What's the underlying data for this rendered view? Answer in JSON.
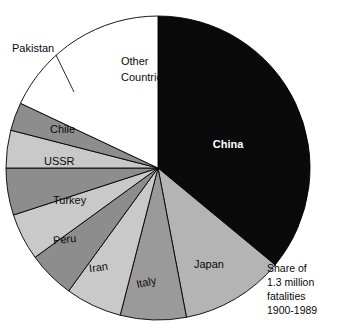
{
  "chart_data": {
    "type": "pie",
    "title": "",
    "caption_lines": [
      "Share of",
      "1.3 million",
      "fatalities",
      "1900-1989"
    ],
    "legend_position": "in-slice labels",
    "grid": false,
    "units": "percent of 1.3 million fatalities",
    "categories": [
      "China",
      "Japan",
      "Italy",
      "Iran",
      "Peru",
      "Turkey",
      "USSR",
      "Chile",
      "Pakistan",
      "Other Countries"
    ],
    "values": [
      36,
      11,
      7,
      6,
      5,
      5,
      5,
      4,
      3,
      18
    ],
    "slices": [
      {
        "label": "China",
        "value": 36,
        "start_angle": 0,
        "end_angle": 129.6,
        "fill": "#0a0a0a",
        "label_fill": "#ffffff",
        "label_x": 228,
        "label_y": 148,
        "label_anchor": "middle",
        "label_bold": true,
        "callout": false
      },
      {
        "label": "Japan",
        "value": 11,
        "start_angle": 129.6,
        "end_angle": 169.2,
        "fill": "#b4b4b4",
        "label_fill": "#0a0a0a",
        "label_x": 209,
        "label_y": 268,
        "label_anchor": "middle",
        "label_bold": false,
        "callout": false
      },
      {
        "label": "Italy",
        "value": 7,
        "start_angle": 169.2,
        "end_angle": 194.4,
        "fill": "#9a9a9a",
        "label_fill": "#0a0a0a",
        "label_x": 147,
        "label_y": 286,
        "label_anchor": "middle",
        "label_bold": false,
        "callout": false
      },
      {
        "label": "Iran",
        "value": 6,
        "start_angle": 194.4,
        "end_angle": 216.0,
        "fill": "#c9c9c9",
        "label_fill": "#0a0a0a",
        "label_x": 99,
        "label_y": 271,
        "label_anchor": "middle",
        "label_bold": false,
        "callout": false
      },
      {
        "label": "Peru",
        "value": 5,
        "start_angle": 216.0,
        "end_angle": 234.0,
        "fill": "#8d8d8d",
        "label_fill": "#0a0a0a",
        "label_x": 65,
        "label_y": 243,
        "label_anchor": "middle",
        "label_bold": false,
        "callout": false
      },
      {
        "label": "Turkey",
        "value": 5,
        "start_angle": 234.0,
        "end_angle": 252.0,
        "fill": "#c9c9c9",
        "label_fill": "#0a0a0a",
        "label_x": 53,
        "label_y": 204,
        "label_anchor": "middle",
        "label_bold": false,
        "callout": false
      },
      {
        "label": "USSR",
        "value": 5,
        "start_angle": 252.0,
        "end_angle": 270.0,
        "fill": "#8d8d8d",
        "label_fill": "#0a0a0a",
        "label_x": 44,
        "label_y": 165,
        "label_anchor": "middle",
        "label_bold": false,
        "callout": false
      },
      {
        "label": "Chile",
        "value": 4,
        "start_angle": 270.0,
        "end_angle": 284.4,
        "fill": "#c9c9c9",
        "label_fill": "#0a0a0a",
        "label_x": 50,
        "label_y": 133,
        "label_anchor": "middle",
        "label_bold": false,
        "callout": false
      },
      {
        "label": "Pakistan",
        "value": 3,
        "start_angle": 284.4,
        "end_angle": 295.2,
        "fill": "#8d8d8d",
        "label_fill": "#0a0a0a",
        "label_x": 42,
        "label_y": 49,
        "label_anchor": "middle",
        "label_bold": false,
        "callout": true,
        "leader_x1": 56,
        "leader_y1": 55,
        "leader_x2": 74,
        "leader_y2": 92
      },
      {
        "label": "Other Countries",
        "value": 18,
        "start_angle": 295.2,
        "end_angle": 360.0,
        "fill": "#ffffff",
        "label_fill": "#0a0a0a",
        "label_x": 121,
        "label_y": 65,
        "label_anchor": "start",
        "label_bold": false,
        "callout": false,
        "label_line_1": "Other",
        "label_line_2": "Countries"
      }
    ]
  },
  "geometry": {
    "center_x": 158,
    "center_y": 168,
    "radius": 152
  },
  "caption": {
    "line1": "Share of",
    "line2": "1.3 million",
    "line3": "fatalities",
    "line4": "1900-1989",
    "x": 267,
    "y1": 272,
    "y2": 286,
    "y3": 300,
    "y4": 314
  },
  "labels": {
    "china": "China",
    "japan": "Japan",
    "italy": "Italy",
    "iran": "Iran",
    "peru": "Peru",
    "turkey": "Turkey",
    "ussr": "USSR",
    "chile": "Chile",
    "pakistan": "Pakistan",
    "other_line1": "Other",
    "other_line2": "Countries"
  }
}
